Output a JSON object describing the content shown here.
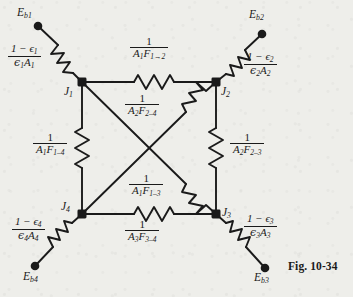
{
  "figure": {
    "caption": "Fig. 10-34",
    "kind": "radiation-network-diagram",
    "background_color": "#eeeeea",
    "ink_color": "#1a1a1a"
  },
  "nodes": [
    {
      "id": "J1",
      "label": "J",
      "sub": "1",
      "x": 82,
      "y": 82,
      "label_x": 63,
      "label_y": 86
    },
    {
      "id": "J2",
      "label": "J",
      "sub": "2",
      "x": 216,
      "y": 82,
      "label_x": 221,
      "label_y": 86
    },
    {
      "id": "J3",
      "label": "J",
      "sub": "3",
      "x": 216,
      "y": 214,
      "label_x": 221,
      "label_y": 209
    },
    {
      "id": "J4",
      "label": "J",
      "sub": "4",
      "x": 82,
      "y": 214,
      "label_x": 60,
      "label_y": 203
    }
  ],
  "terminals": [
    {
      "id": "Eb1",
      "label": "E",
      "sub": "b1",
      "x": 38,
      "y": 26,
      "label_x": 17,
      "label_y": 8
    },
    {
      "id": "Eb2",
      "label": "E",
      "sub": "b2",
      "x": 262,
      "y": 34,
      "label_x": 252,
      "label_y": 10
    },
    {
      "id": "Eb3",
      "label": "E",
      "sub": "b3",
      "x": 265,
      "y": 268,
      "label_x": 255,
      "label_y": 272
    },
    {
      "id": "Eb4",
      "label": "E",
      "sub": "b4",
      "x": 35,
      "y": 266,
      "label_x": 24,
      "label_y": 271
    }
  ],
  "surface_resistances": [
    {
      "id": "R-surface-1",
      "numerator": "1 − ϵ",
      "numerator_sub": "1",
      "denominator": "ϵ",
      "denominator_sub": "1",
      "denominator_tail": "A",
      "denominator_tail_sub": "1",
      "label_x": 8,
      "label_y": 45
    },
    {
      "id": "R-surface-2",
      "numerator": "1 − ϵ",
      "numerator_sub": "2",
      "denominator": "ϵ",
      "denominator_sub": "2",
      "denominator_tail": "A",
      "denominator_tail_sub": "2",
      "label_x": 245,
      "label_y": 53
    },
    {
      "id": "R-surface-3",
      "numerator": "1 − ϵ",
      "numerator_sub": "3",
      "denominator": "ϵ",
      "denominator_sub": "3",
      "denominator_tail": "A",
      "denominator_tail_sub": "3",
      "label_x": 245,
      "label_y": 215
    },
    {
      "id": "R-surface-4",
      "numerator": "1 − ϵ",
      "numerator_sub": "4",
      "denominator": "ϵ",
      "denominator_sub": "4",
      "denominator_tail": "A",
      "denominator_tail_sub": "4",
      "label_x": 12,
      "label_y": 218
    }
  ],
  "space_resistances": [
    {
      "id": "R-space-1-2",
      "numerator": "1",
      "den_A": "A",
      "den_A_sub": "1",
      "den_F": "F",
      "den_F_sub": "1→2",
      "label_x": 131,
      "label_y": 39
    },
    {
      "id": "R-space-2-4",
      "numerator": "1",
      "den_A": "A",
      "den_A_sub": "2",
      "den_F": "F",
      "den_F_sub": "2–4",
      "label_x": 126,
      "label_y": 96
    },
    {
      "id": "R-space-1-4",
      "numerator": "1",
      "den_A": "A",
      "den_A_sub": "1",
      "den_F": "F",
      "den_F_sub": "1–4",
      "label_x": 34,
      "label_y": 135
    },
    {
      "id": "R-space-2-3",
      "numerator": "1",
      "den_A": "A",
      "den_A_sub": "2",
      "den_F": "F",
      "den_F_sub": "2–3",
      "label_x": 231,
      "label_y": 135
    },
    {
      "id": "R-space-1-3",
      "numerator": "1",
      "den_A": "A",
      "den_A_sub": "1",
      "den_F": "F",
      "den_F_sub": "1–3",
      "label_x": 130,
      "label_y": 176
    },
    {
      "id": "R-space-3-4",
      "numerator": "1",
      "den_A": "A",
      "den_A_sub": "3",
      "den_F": "F",
      "den_F_sub": "3–4",
      "label_x": 126,
      "label_y": 222
    }
  ],
  "caption_position": {
    "x": 288,
    "y": 262
  }
}
